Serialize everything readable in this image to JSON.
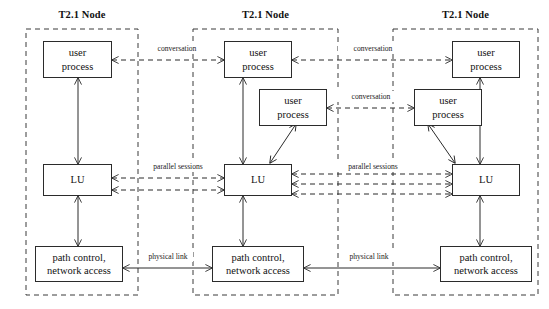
{
  "diagram": {
    "title_text": "T2.1 Node",
    "nodes": [
      {
        "id": "node-left",
        "title": "T2.1 Node",
        "boxes": [
          {
            "id": "user-process-1",
            "lines": [
              "user",
              "process"
            ]
          },
          {
            "id": "lu",
            "lines": [
              "LU"
            ]
          },
          {
            "id": "path-control",
            "lines": [
              "path control,",
              "network access"
            ]
          }
        ]
      },
      {
        "id": "node-middle",
        "title": "T2.1 Node",
        "boxes": [
          {
            "id": "user-process-1",
            "lines": [
              "user",
              "process"
            ]
          },
          {
            "id": "user-process-2",
            "lines": [
              "user",
              "process"
            ]
          },
          {
            "id": "lu",
            "lines": [
              "LU"
            ]
          },
          {
            "id": "path-control",
            "lines": [
              "path control,",
              "network access"
            ]
          }
        ]
      },
      {
        "id": "node-right",
        "title": "T2.1 Node",
        "boxes": [
          {
            "id": "user-process-1",
            "lines": [
              "user",
              "process"
            ]
          },
          {
            "id": "user-process-2",
            "lines": [
              "user",
              "process"
            ]
          },
          {
            "id": "lu",
            "lines": [
              "LU"
            ]
          },
          {
            "id": "path-control",
            "lines": [
              "path control,",
              "network access"
            ]
          }
        ]
      }
    ],
    "edge_labels": [
      {
        "id": "conversation-left-middle-top",
        "text": "conversation"
      },
      {
        "id": "conversation-middle-right-top",
        "text": "conversation"
      },
      {
        "id": "conversation-middle-right-second",
        "text": "conversation"
      },
      {
        "id": "parallel-sessions-left-middle",
        "text": "parallel sessions"
      },
      {
        "id": "parallel-sessions-middle-right",
        "text": "parallel sessions"
      },
      {
        "id": "physical-link-left-middle",
        "line1": "physical",
        "line2": "link"
      },
      {
        "id": "physical-link-middle-right",
        "line1": "physical",
        "line2": "link"
      }
    ],
    "colors": {
      "stroke": "#2b2b2b",
      "boundary": "#3a3a3a",
      "text": "#111111",
      "background": "#ffffff"
    }
  }
}
